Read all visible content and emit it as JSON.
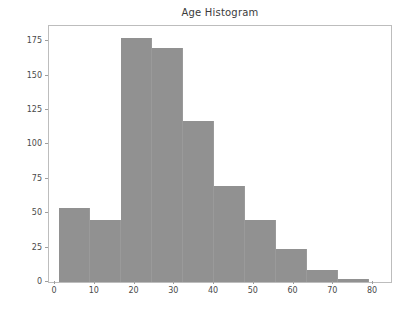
{
  "figure": {
    "width": 408,
    "height": 313,
    "background": "#ffffff"
  },
  "chart_data": {
    "type": "bar",
    "title": "Age Histogram",
    "xlabel": "",
    "ylabel": "",
    "bar_color": "#919191",
    "grid": false,
    "legend": false,
    "xlim": [
      -1.5,
      84.5
    ],
    "ylim": [
      0,
      186
    ],
    "xticks": [
      0,
      10,
      20,
      30,
      40,
      50,
      60,
      70,
      80
    ],
    "xtick_labels": [
      "0",
      "10",
      "20",
      "30",
      "40",
      "50",
      "60",
      "70",
      "80"
    ],
    "yticks": [
      0,
      25,
      50,
      75,
      100,
      125,
      150,
      175
    ],
    "ytick_labels": [
      "0",
      "25",
      "50",
      "75",
      "100",
      "125",
      "150",
      "175"
    ],
    "bin_edges": [
      1,
      8.8,
      16.6,
      24.4,
      32.2,
      40,
      47.8,
      55.6,
      63.4,
      71.2,
      79
    ],
    "bins": [
      {
        "left": 1,
        "right": 8.8,
        "value": 54
      },
      {
        "left": 8.8,
        "right": 16.6,
        "value": 45
      },
      {
        "left": 16.6,
        "right": 24.4,
        "value": 177
      },
      {
        "left": 24.4,
        "right": 32.2,
        "value": 170
      },
      {
        "left": 32.2,
        "right": 40,
        "value": 117
      },
      {
        "left": 40,
        "right": 47.8,
        "value": 70
      },
      {
        "left": 47.8,
        "right": 55.6,
        "value": 45
      },
      {
        "left": 55.6,
        "right": 63.4,
        "value": 24
      },
      {
        "left": 63.4,
        "right": 71.2,
        "value": 9
      },
      {
        "left": 71.2,
        "right": 79,
        "value": 2
      }
    ],
    "categories": [
      "1-8.8",
      "8.8-16.6",
      "16.6-24.4",
      "24.4-32.2",
      "32.2-40",
      "40-47.8",
      "47.8-55.6",
      "55.6-63.4",
      "63.4-71.2",
      "71.2-79"
    ],
    "values": [
      54,
      45,
      177,
      170,
      117,
      70,
      45,
      24,
      9,
      2
    ]
  }
}
